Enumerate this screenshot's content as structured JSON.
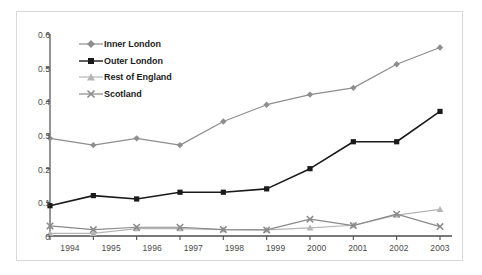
{
  "chart_data": {
    "type": "line",
    "title": "",
    "subtitle": "",
    "xlabel": "",
    "ylabel": "",
    "categories": [
      "1994",
      "1995",
      "1996",
      "1997",
      "1998",
      "1999",
      "2000",
      "2001",
      "2002",
      "2003"
    ],
    "x": [
      1994,
      1995,
      1996,
      1997,
      1998,
      1999,
      2000,
      2001,
      2002,
      2003
    ],
    "ylim": [
      0,
      0.6
    ],
    "yticks": [
      0,
      0.1,
      0.2,
      0.3,
      0.4,
      0.5,
      0.6
    ],
    "ytick_labels": [
      "0",
      "0.1",
      "0.2",
      "0.3",
      "0.4",
      "0.5",
      "0.6"
    ],
    "grid": false,
    "legend_position": "inside-top-left",
    "series": [
      {
        "name": "Inner London",
        "marker": "diamond",
        "color": "#8e8e8e",
        "values": [
          0.29,
          0.27,
          0.29,
          0.27,
          0.34,
          0.39,
          0.42,
          0.44,
          0.51,
          0.56
        ]
      },
      {
        "name": "Outer London",
        "marker": "square",
        "color": "#1a1a1a",
        "values": [
          0.09,
          0.12,
          0.11,
          0.13,
          0.13,
          0.14,
          0.2,
          0.28,
          0.28,
          0.37
        ]
      },
      {
        "name": "Rest of England",
        "marker": "triangle",
        "color": "#b5b5b5",
        "values": [
          0.008,
          0.008,
          0.022,
          0.022,
          0.019,
          0.018,
          0.024,
          0.032,
          0.062,
          0.079
        ]
      },
      {
        "name": "Scotland",
        "marker": "cross",
        "color": "#8a8a8a",
        "values": [
          0.03,
          0.019,
          0.026,
          0.026,
          0.019,
          0.018,
          0.05,
          0.031,
          0.065,
          0.028
        ]
      }
    ]
  },
  "axis": {
    "y_tick_labels": [
      "0.6",
      "0.5",
      "0.4",
      "0.3",
      "0.2",
      "0.1",
      "0"
    ],
    "x_tick_labels": [
      "1994",
      "1995",
      "1996",
      "1997",
      "1998",
      "1999",
      "2000",
      "2001",
      "2002",
      "2003"
    ]
  },
  "legend": {
    "items": [
      {
        "label": "Inner London"
      },
      {
        "label": "Outer London"
      },
      {
        "label": "Rest of England"
      },
      {
        "label": "Scotland"
      }
    ]
  }
}
